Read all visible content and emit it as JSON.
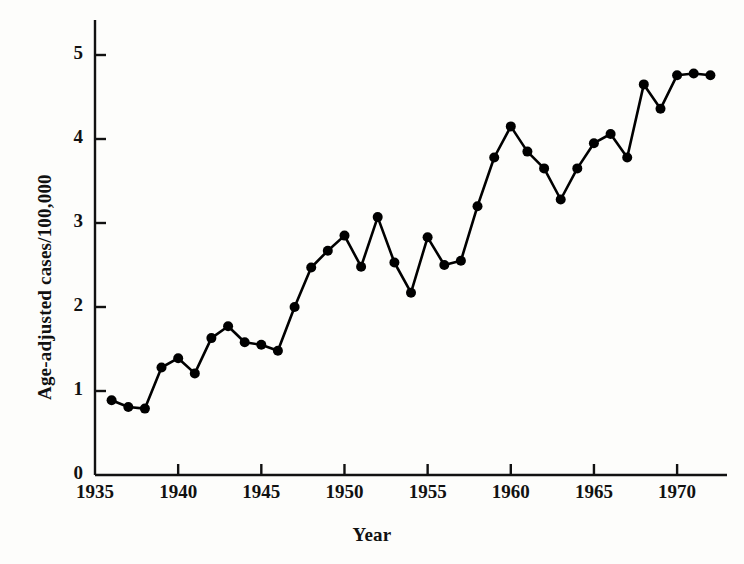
{
  "chart_data": {
    "type": "line",
    "title": "",
    "xlabel": "Year",
    "ylabel": "Age-adjusted cases/100,000",
    "xlim": [
      1935,
      1973
    ],
    "ylim": [
      0,
      5.35
    ],
    "grid": false,
    "legend": "none",
    "marker": "filled-circle",
    "line_color": "#000000",
    "x": [
      1936,
      1937,
      1938,
      1939,
      1940,
      1941,
      1942,
      1943,
      1944,
      1945,
      1946,
      1947,
      1948,
      1949,
      1950,
      1951,
      1952,
      1953,
      1954,
      1955,
      1956,
      1957,
      1958,
      1959,
      1960,
      1961,
      1962,
      1963,
      1964,
      1965,
      1966,
      1967,
      1968,
      1969,
      1970,
      1971,
      1972
    ],
    "values": [
      0.89,
      0.81,
      0.79,
      1.28,
      1.39,
      1.21,
      1.63,
      1.77,
      1.58,
      1.55,
      1.48,
      2.0,
      2.47,
      2.67,
      2.85,
      2.48,
      3.07,
      2.53,
      2.17,
      2.83,
      2.5,
      2.55,
      3.2,
      3.78,
      4.15,
      3.85,
      3.65,
      3.28,
      3.65,
      3.95,
      4.06,
      3.78,
      4.65,
      4.36,
      4.76,
      4.78,
      4.76
    ],
    "xticks": [
      1935,
      1940,
      1945,
      1950,
      1955,
      1960,
      1965,
      1970
    ],
    "xtick_labels": [
      "1935",
      "1940",
      "1945",
      "1950",
      "1955",
      "1960",
      "1965",
      "1970"
    ],
    "yticks": [
      0,
      1,
      2,
      3,
      4,
      5
    ],
    "ytick_labels": [
      "0",
      "1",
      "2",
      "3",
      "4",
      "5"
    ]
  }
}
